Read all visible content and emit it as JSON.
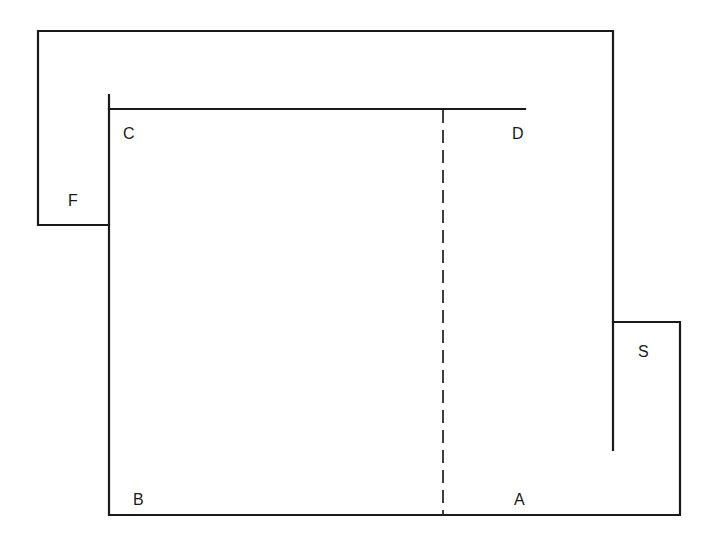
{
  "diagram": {
    "type": "floor-plan-outline",
    "stroke_color": "#1a1a1a",
    "background": "#ffffff",
    "labels": {
      "A": "A",
      "B": "B",
      "C": "C",
      "D": "D",
      "F": "F",
      "S": "S"
    },
    "elements": [
      {
        "name": "outer-wrap",
        "description": "Outer boundary running from F across the top and down the right side to S"
      },
      {
        "name": "inner-room",
        "description": "Inner region bounded by C, D, B, A"
      },
      {
        "name": "dashed-divider",
        "description": "Dashed vertical line from CD top edge to BA bottom edge"
      }
    ]
  }
}
